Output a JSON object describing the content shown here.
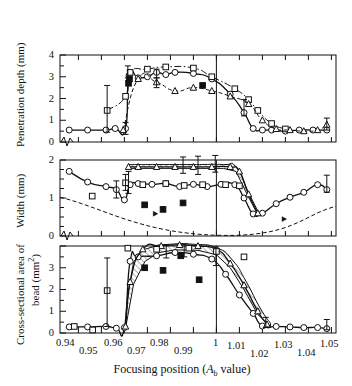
{
  "figure": {
    "xtitle": "Focusing position (A_b value)",
    "xtitle_main": "Focusing position (",
    "xtitle_italic": "A",
    "xtitle_sub": "b",
    "xtitle_tail": " value)"
  },
  "panels": {
    "top": {
      "ylabel": "Penetration depth (mm)",
      "yticks": [
        "0",
        "1",
        "2",
        "3",
        "4"
      ],
      "ylim": [
        0,
        4
      ]
    },
    "middle": {
      "ylabel": "Width (mm)",
      "yticks": [
        "0",
        "1",
        "2"
      ],
      "ylim": [
        0,
        2
      ]
    },
    "bottom": {
      "ylabel_line1": "Cross-sectional area of",
      "ylabel_line2": "bead (mm²)",
      "yticks": [
        "0",
        "1",
        "2",
        "3"
      ],
      "ylim": [
        0,
        4
      ]
    }
  },
  "xaxis": {
    "ticks": [
      "0.94",
      "0.95",
      "0.96",
      "0.97",
      "0.98",
      "0.99",
      "1",
      "1.01",
      "1.02",
      "1.03",
      "1.04",
      "1.05"
    ],
    "tickvalues": [
      0.94,
      0.95,
      0.96,
      0.97,
      0.98,
      0.99,
      1.0,
      1.01,
      1.02,
      1.03,
      1.04,
      1.05
    ],
    "min": 0.932,
    "max": 1.052,
    "reference_line": 1.0
  },
  "chart_data": {
    "type": "line",
    "title": "",
    "xlabel": "Focusing position (A_b value)",
    "xlim": [
      0.932,
      1.052
    ],
    "grid": false,
    "legend": "none",
    "panels": [
      {
        "name": "Penetration depth",
        "ylabel": "Penetration depth (mm)",
        "ylim": [
          0,
          4
        ],
        "yticks": [
          0,
          1,
          2,
          3,
          4
        ],
        "series": [
          {
            "name": "circle-solid-line",
            "marker": "open-circle",
            "line": "solid",
            "x": [
              0.936,
              0.944,
              0.952,
              0.956,
              0.9605,
              0.962,
              0.966,
              0.97,
              0.974,
              0.978,
              0.982,
              0.99,
              0.998,
              1.006,
              1.012,
              1.016,
              1.02,
              1.024,
              1.03,
              1.036,
              1.042,
              1.048
            ],
            "y": [
              0.55,
              0.55,
              0.55,
              0.62,
              0.62,
              3.05,
              2.95,
              3.0,
              3.2,
              3.1,
              3.2,
              3.15,
              2.9,
              2.2,
              1.35,
              0.62,
              0.55,
              0.55,
              0.5,
              0.55,
              0.55,
              0.55
            ]
          },
          {
            "name": "square-dashdot-line",
            "marker": "open-square",
            "line": "dash-dot",
            "x": [
              0.9525,
              0.9605,
              0.9625,
              0.97,
              0.978,
              0.99,
              0.998,
              1.008,
              1.014,
              1.018,
              1.024,
              1.03
            ],
            "y": [
              1.45,
              2.1,
              3.2,
              3.35,
              3.45,
              3.4,
              3.0,
              2.45,
              1.95,
              1.45,
              0.85,
              0.6
            ]
          },
          {
            "name": "triangle-dashed-line",
            "marker": "open-triangle",
            "line": "dashed",
            "x": [
              0.9595,
              0.966,
              0.974,
              0.982,
              0.99,
              0.998,
              1.006,
              1.014,
              1.02,
              1.026,
              1.032,
              1.038,
              1.044,
              1.048
            ],
            "y": [
              0.55,
              2.9,
              2.75,
              2.35,
              2.5,
              2.35,
              2.1,
              1.75,
              1.0,
              0.6,
              0.55,
              0.5,
              0.55,
              0.8
            ]
          },
          {
            "name": "filled-square-points",
            "marker": "filled-square",
            "line": "none",
            "x": [
              0.9618,
              0.9622,
              0.994
            ],
            "y": [
              2.7,
              2.9,
              2.6
            ]
          }
        ],
        "error_bars": [
          {
            "x": 0.9525,
            "y": 1.45,
            "low": 0.45,
            "high": 2.6
          },
          {
            "x": 0.9615,
            "y": 3.2,
            "low": 2.95,
            "high": 3.5
          },
          {
            "x": 0.9605,
            "y": 0.62,
            "low": 0.35,
            "high": 0.9
          },
          {
            "x": 0.974,
            "y": 3.2,
            "low": 2.95,
            "high": 3.35
          },
          {
            "x": 0.974,
            "y": 2.75,
            "low": 2.5,
            "high": 2.95
          },
          {
            "x": 1.012,
            "y": 1.55,
            "low": 1.2,
            "high": 1.95
          },
          {
            "x": 1.048,
            "y": 0.8,
            "low": 0.55,
            "high": 1.1
          }
        ]
      },
      {
        "name": "Width",
        "ylabel": "Width (mm)",
        "ylim": [
          0,
          2
        ],
        "yticks": [
          0,
          1,
          2
        ],
        "series": [
          {
            "name": "circle-solid-line",
            "marker": "open-circle",
            "line": "solid",
            "x": [
              0.936,
              0.944,
              0.952,
              0.9565,
              0.96,
              0.9625,
              0.966,
              0.972,
              0.978,
              0.984,
              0.99,
              0.996,
              1.002,
              1.008,
              1.012,
              1.016,
              1.02,
              1.026,
              1.032,
              1.038,
              1.044,
              1.048
            ],
            "y": [
              1.7,
              1.42,
              1.3,
              1.22,
              0.95,
              1.35,
              1.38,
              1.36,
              1.38,
              1.3,
              1.36,
              1.3,
              1.36,
              1.35,
              1.0,
              0.58,
              0.6,
              0.85,
              1.02,
              1.15,
              1.35,
              1.22
            ]
          },
          {
            "name": "triangle-hatchband-top",
            "marker": "open-triangle",
            "line": "solid",
            "x": [
              0.9618,
              0.966,
              0.974,
              0.982,
              0.99,
              0.998,
              1.006,
              1.01,
              1.014,
              1.018
            ],
            "y": [
              1.82,
              1.82,
              1.82,
              1.82,
              1.82,
              1.82,
              1.82,
              1.7,
              1.1,
              0.6
            ]
          },
          {
            "name": "square-points",
            "marker": "open-square",
            "line": "none",
            "x": [
              0.946,
              0.9605,
              0.968,
              0.978,
              0.986,
              0.994,
              1.004,
              1.01
            ],
            "y": [
              1.05,
              1.4,
              1.35,
              1.38,
              1.33,
              1.35,
              1.35,
              1.32
            ]
          },
          {
            "name": "filled-square-points",
            "marker": "filled-square",
            "line": "none",
            "x": [
              0.9688,
              0.9768,
              0.9855
            ],
            "y": [
              0.82,
              0.7,
              0.87
            ]
          },
          {
            "name": "V-dashed-baseline",
            "marker": "none",
            "line": "dashed",
            "x": [
              0.932,
              1.0,
              1.052
            ],
            "y": [
              1.02,
              0.02,
              0.78
            ]
          }
        ],
        "error_bars": [
          {
            "x": 0.9605,
            "y": 1.4,
            "low": 1.2,
            "high": 1.62
          },
          {
            "x": 0.9565,
            "y": 1.22,
            "low": 1.0,
            "high": 1.45
          },
          {
            "x": 0.9618,
            "y": 1.4,
            "low": 1.12,
            "high": 1.7
          },
          {
            "x": 0.9855,
            "y": 1.82,
            "low": 1.65,
            "high": 2.08
          },
          {
            "x": 0.992,
            "y": 1.82,
            "low": 1.62,
            "high": 2.1
          },
          {
            "x": 0.9995,
            "y": 1.82,
            "low": 1.68,
            "high": 2.12
          },
          {
            "x": 1.048,
            "y": 1.35,
            "low": 1.15,
            "high": 1.6
          }
        ]
      },
      {
        "name": "Cross-sectional area of bead",
        "ylabel": "Cross-sectional area of bead (mm²)",
        "ylim": [
          0,
          4
        ],
        "yticks": [
          0,
          1,
          2,
          3
        ],
        "series": [
          {
            "name": "circle-solid-line",
            "marker": "open-circle",
            "line": "solid",
            "x": [
              0.936,
              0.944,
              0.952,
              0.9565,
              0.96,
              0.9625,
              0.966,
              0.974,
              0.982,
              0.99,
              0.998,
              1.004,
              1.01,
              1.016,
              1.02,
              1.026,
              1.032,
              1.038,
              1.044,
              1.048
            ],
            "y": [
              0.28,
              0.28,
              0.3,
              0.22,
              0.25,
              3.3,
              3.5,
              3.55,
              3.7,
              3.62,
              3.4,
              2.7,
              1.75,
              0.9,
              0.32,
              0.3,
              0.28,
              0.25,
              0.25,
              0.2
            ]
          },
          {
            "name": "triangle-hatchband-upper",
            "marker": "open-triangle",
            "line": "solid",
            "x": [
              0.9605,
              0.9625,
              0.968,
              0.976,
              0.984,
              0.992,
              1.0,
              1.006,
              1.012,
              1.018,
              1.022
            ],
            "y": [
              0.3,
              2.35,
              3.85,
              4.0,
              4.05,
              4.0,
              3.85,
              3.2,
              2.2,
              1.0,
              0.4
            ]
          },
          {
            "name": "square-points",
            "marker": "open-square",
            "line": "none",
            "x": [
              0.9382,
              0.9462,
              0.9525,
              0.9615,
              0.974,
              0.988,
              1.0,
              1.012
            ],
            "y": [
              0.3,
              0.14,
              1.95,
              3.9,
              3.85,
              3.9,
              3.75,
              3.5
            ]
          },
          {
            "name": "filled-square-points",
            "marker": "filled-square",
            "line": "none",
            "x": [
              0.9688,
              0.9768,
              0.9845,
              0.9925
            ],
            "y": [
              3.0,
              2.88,
              3.55,
              2.45
            ]
          }
        ],
        "error_bars": [
          {
            "x": 0.9525,
            "y": 1.95,
            "low": 0.3,
            "high": 3.45
          },
          {
            "x": 0.9782,
            "y": 3.72,
            "low": 3.45,
            "high": 4.05
          },
          {
            "x": 0.986,
            "y": 3.75,
            "low": 3.5,
            "high": 4.1
          },
          {
            "x": 0.9998,
            "y": 3.5,
            "low": 3.1,
            "high": 3.95
          },
          {
            "x": 1.0215,
            "y": 0.42,
            "low": 0.25,
            "high": 0.72
          },
          {
            "x": 1.048,
            "y": 0.3,
            "low": 0.15,
            "high": 0.62
          }
        ]
      }
    ]
  }
}
